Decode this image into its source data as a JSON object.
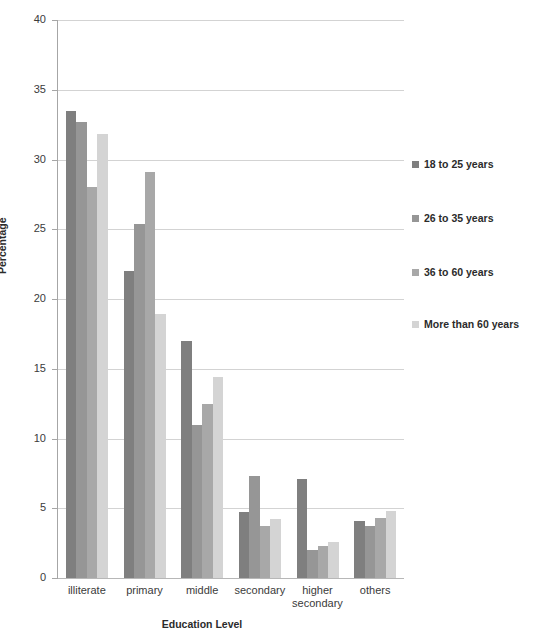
{
  "chart_data": {
    "type": "bar",
    "title": "",
    "xlabel": "Education Level",
    "ylabel": "Percentage",
    "ylim": [
      0,
      40
    ],
    "yticks": [
      0,
      5,
      10,
      15,
      20,
      25,
      30,
      35,
      40
    ],
    "grid": true,
    "legend_position": "right",
    "categories": [
      "illiterate",
      "primary",
      "middle",
      "secondary",
      "higher secondary",
      "others"
    ],
    "series": [
      {
        "name": "18 to 25 years",
        "color": "#7f7f7f",
        "values": [
          33.5,
          22.0,
          17.0,
          4.7,
          7.1,
          4.1
        ]
      },
      {
        "name": "26 to 35 years",
        "color": "#969696",
        "values": [
          32.7,
          25.4,
          11.0,
          7.3,
          2.0,
          3.7
        ]
      },
      {
        "name": "36 to 60 years",
        "color": "#a8a8a8",
        "values": [
          28.0,
          29.1,
          12.5,
          3.7,
          2.3,
          4.3
        ]
      },
      {
        "name": "More than 60 years",
        "color": "#d4d4d4",
        "values": [
          31.8,
          18.9,
          14.4,
          4.2,
          2.6,
          4.8
        ]
      }
    ]
  },
  "axis": {
    "y_title": "Percentage",
    "x_title": "Education Level"
  },
  "colors": {
    "gridline": "#d3d3d3",
    "axis": "#a6a6a6",
    "text": "#3b3b3b"
  }
}
